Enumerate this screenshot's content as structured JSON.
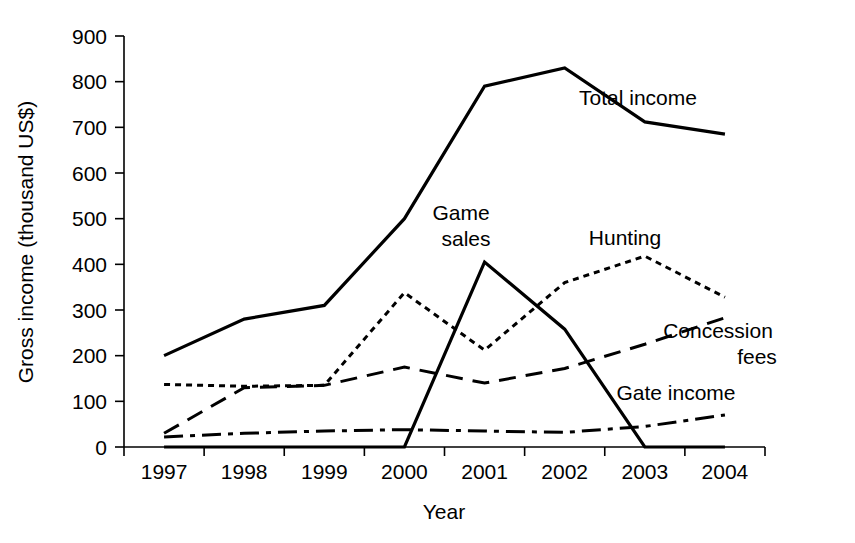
{
  "chart_data": {
    "type": "line",
    "title": "",
    "xlabel": "Year",
    "ylabel": "Gross income (thousand US$)",
    "categories": [
      "1997",
      "1998",
      "1999",
      "2000",
      "2001",
      "2002",
      "2003",
      "2004"
    ],
    "ylim": [
      0,
      900
    ],
    "yticks": [
      "0",
      "100",
      "200",
      "300",
      "400",
      "500",
      "600",
      "700",
      "800",
      "900"
    ],
    "ytick_values": [
      0,
      100,
      200,
      300,
      400,
      500,
      600,
      700,
      800,
      900
    ],
    "grid": false,
    "legend_position": "inline-labels",
    "series": [
      {
        "name": "Total income",
        "style": "solid",
        "color": "#000000",
        "width": 3.2,
        "values": [
          200,
          280,
          310,
          500,
          790,
          830,
          712,
          685
        ],
        "label_x": 2004,
        "label_text": "Total income"
      },
      {
        "name": "Hunting",
        "style": "dotted",
        "color": "#000000",
        "width": 3.0,
        "values": [
          137,
          133,
          135,
          338,
          212,
          360,
          418,
          328
        ],
        "label_text": "Hunting"
      },
      {
        "name": "Concession fees",
        "style": "long-dashed",
        "color": "#000000",
        "width": 3.0,
        "values": [
          30,
          130,
          135,
          175,
          140,
          172,
          225,
          283
        ],
        "label_text": "Concession fees"
      },
      {
        "name": "Gate income",
        "style": "dash-dot",
        "color": "#000000",
        "width": 3.0,
        "values": [
          22,
          30,
          35,
          38,
          35,
          32,
          45,
          70
        ],
        "label_text": "Gate income"
      },
      {
        "name": "Game sales",
        "style": "solid",
        "color": "#000000",
        "width": 3.2,
        "values": [
          0,
          0,
          0,
          0,
          405,
          258,
          0,
          0
        ],
        "label_text": "Game sales"
      }
    ],
    "annotations": [
      {
        "text": "Total income",
        "x": 638,
        "y": 105
      },
      {
        "text": "Game",
        "x": 461,
        "y": 220
      },
      {
        "text": "sales",
        "x": 466,
        "y": 246
      },
      {
        "text": "Hunting",
        "x": 625,
        "y": 245
      },
      {
        "text": "Concession",
        "x": 718,
        "y": 338
      },
      {
        "text": "fees",
        "x": 757,
        "y": 364
      },
      {
        "text": "Gate income",
        "x": 676,
        "y": 400
      }
    ]
  },
  "axis": {
    "y_title": "Gross income (thousand US$)",
    "x_title": "Year"
  }
}
